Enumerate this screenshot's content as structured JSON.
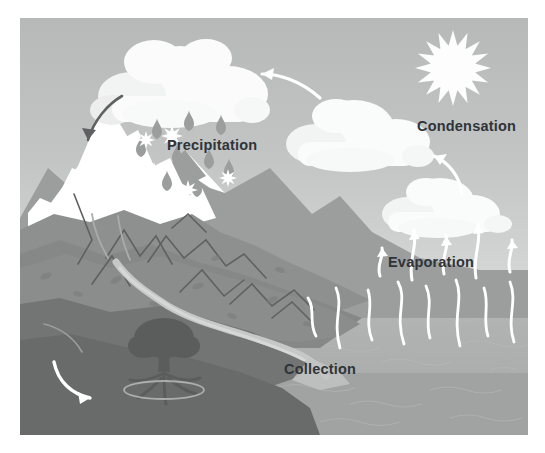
{
  "diagram": {
    "type": "illustration",
    "labels": {
      "precipitation": "Precipitation",
      "condensation": "Condensation",
      "evaporation": "Evaporation",
      "collection": "Collection"
    },
    "label_color": "#2f3438",
    "colors": {
      "sky_upper": "#b9bbbb",
      "sky_lower": "#d2d4d4",
      "sea_upper": "#b4b6b6",
      "sea_lower": "#a3a5a5",
      "mountain_light": "#9a9c9c",
      "mountain_mid": "#8a8c8c",
      "mountain_dark": "#7a7c7c",
      "underground": "#6d6f6f",
      "underground_deep": "#636565",
      "snow": "#ffffff",
      "cloud": "#fbfbfb",
      "cloud_shade": "#eceded",
      "sun": "#fdfdfd",
      "raindrop": "#9b9d9d",
      "snowflake": "#ffffff",
      "arrow_white": "#ffffff",
      "arrow_dark": "#5d6060",
      "river": "#c9cbcb",
      "tree": "#5a5c5c"
    },
    "elements": {
      "sun": {
        "name": "sun",
        "rays": 16
      },
      "clouds": [
        {
          "name": "rain-cloud",
          "position": "top-left"
        },
        {
          "name": "condensation-cloud",
          "position": "top-right"
        },
        {
          "name": "evaporation-cloud",
          "position": "mid-right"
        }
      ],
      "precipitation": {
        "raindrops": 9,
        "snowflakes": 5
      },
      "evaporation_arrows": 5,
      "collection_streaks": 8,
      "mountains": {
        "snow_capped_peaks": 2
      },
      "tree": {
        "name": "tree",
        "has_roots": true
      },
      "river": {
        "name": "river",
        "flows_to": "sea"
      },
      "groundwater_arrow": {
        "name": "groundwater-flow-arrow",
        "direction": "right"
      },
      "snowmelt_arrow": {
        "name": "snowmelt-arrow",
        "direction": "down-left"
      },
      "cloud_transport_arrow": {
        "name": "cloud-transport-arrow",
        "direction": "left"
      },
      "condensation_arrow": {
        "name": "condensation-arrow",
        "direction": "up-left"
      }
    }
  }
}
